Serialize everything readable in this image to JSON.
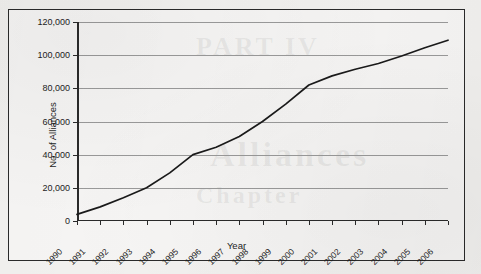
{
  "page": {
    "bleed_text": [
      "PART IV",
      "Alliances",
      "Chapter"
    ]
  },
  "chart_data": {
    "type": "line",
    "title": "",
    "xlabel": "Year",
    "ylabel": "No. of Alliances",
    "categories": [
      "1990",
      "1991",
      "1992",
      "1993",
      "1994",
      "1995",
      "1996",
      "1997",
      "1998",
      "1999",
      "2000",
      "2001",
      "2002",
      "2003",
      "2004",
      "2005",
      "2006"
    ],
    "values": [
      4000,
      8500,
      14000,
      20000,
      29000,
      40000,
      44500,
      51000,
      60000,
      70500,
      82000,
      87500,
      91500,
      95000,
      99500,
      104500,
      109000
    ],
    "series": [
      {
        "name": "No. of Alliances",
        "values": [
          4000,
          8500,
          14000,
          20000,
          29000,
          40000,
          44500,
          51000,
          60000,
          70500,
          82000,
          87500,
          91500,
          95000,
          99500,
          104500,
          109000
        ]
      }
    ],
    "ylim": [
      0,
      120000
    ],
    "yticks": [
      0,
      20000,
      40000,
      60000,
      80000,
      100000,
      120000
    ],
    "ytick_labels": [
      "0",
      "20,000",
      "40,000",
      "60,000",
      "80,000",
      "100,000",
      "120,000"
    ],
    "grid": true,
    "legend": "none",
    "line_color": "#1a1a1a",
    "grid_color": "#9a9a9a",
    "axis_color": "#2a2a2a"
  }
}
